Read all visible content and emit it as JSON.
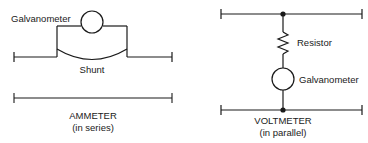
{
  "figure": {
    "panels": [
      {
        "id": "ammeter",
        "caption_title": "AMMETER",
        "caption_subtitle": "(in series)",
        "labels": {
          "galvanometer": "Galvanometer",
          "shunt": "Shunt"
        }
      },
      {
        "id": "voltmeter",
        "caption_title": "VOLTMETER",
        "caption_subtitle": "(in parallel)",
        "labels": {
          "resistor": "Resistor",
          "galvanometer": "Galvanometer"
        }
      }
    ],
    "colors": {
      "background": "#ffffff",
      "line": "#1a1a1a",
      "text": "#1a1a1a"
    }
  }
}
